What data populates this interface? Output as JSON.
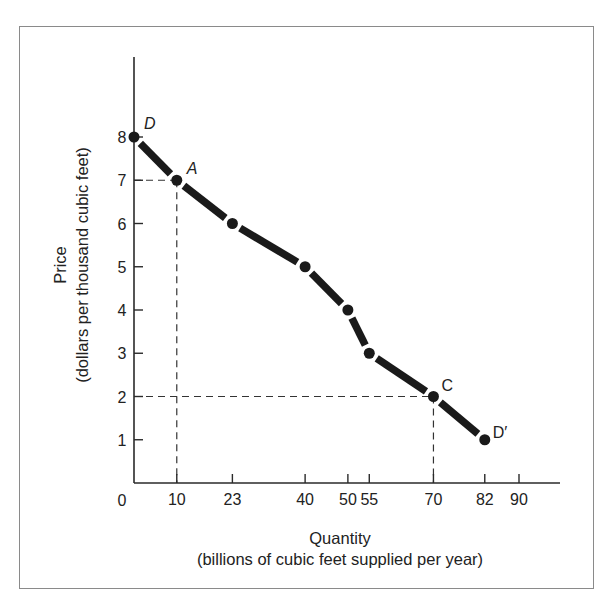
{
  "chart_data": {
    "type": "line",
    "title": "",
    "xlabel": "Quantity",
    "xlabel_sub": "(billions of cubic feet supplied per year)",
    "ylabel": "Price",
    "ylabel_sub": "(dollars per thousand cubic feet)",
    "xlim": [
      0,
      100
    ],
    "ylim": [
      0,
      10
    ],
    "x_ticks": [
      10,
      23,
      40,
      50,
      55,
      70,
      82,
      90
    ],
    "x_tick_labels": [
      "10",
      "23",
      "40",
      "50",
      "55",
      "70",
      "82",
      "90"
    ],
    "y_ticks": [
      1,
      2,
      3,
      4,
      5,
      6,
      7,
      8
    ],
    "y_tick_labels": [
      "1",
      "2",
      "3",
      "4",
      "5",
      "6",
      "7",
      "8"
    ],
    "origin_label": "0",
    "grid": false,
    "legend": "none",
    "series": [
      {
        "name": "Demand curve DD'",
        "x": [
          0,
          10,
          23,
          40,
          50,
          55,
          70,
          82
        ],
        "y": [
          8,
          7,
          6,
          5,
          4,
          3,
          2,
          1
        ],
        "style": "thick-dashed-with-dots",
        "color": "#1a1a1a"
      }
    ],
    "point_labels": [
      {
        "text": "D",
        "x": 0,
        "y": 8,
        "italic": true
      },
      {
        "text": "A",
        "x": 10,
        "y": 7,
        "italic": true
      },
      {
        "text": "C",
        "x": 70,
        "y": 2,
        "italic": false
      },
      {
        "text": "D′",
        "x": 82,
        "y": 1,
        "italic": false
      }
    ],
    "reference_lines": [
      {
        "point": "A",
        "x": 10,
        "y": 7
      },
      {
        "point": "C",
        "x": 70,
        "y": 2
      }
    ]
  }
}
